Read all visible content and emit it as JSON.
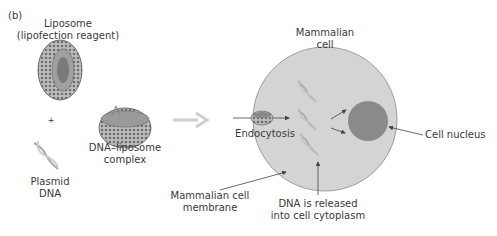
{
  "panel_label": "(b)",
  "labels": {
    "liposome_line1": "Liposome",
    "liposome_line2": "(lipofection reagent)",
    "plus": "+",
    "plasmid_line1": "Plasmid",
    "plasmid_line2": "DNA",
    "complex_line1": "DNA–liposome",
    "complex_line2": "complex",
    "cell_line1": "Mammalian",
    "cell_line2": "cell",
    "endocytosis": "Endocytosis",
    "nucleus": "Cell nucleus",
    "membrane_line1": "Mammalian cell",
    "membrane_line2": "membrane",
    "released_line1": "DNA is released",
    "released_line2": "into cell cytoplasm"
  },
  "colors": {
    "cell_fill": "#d4d4d4",
    "nucleus_fill": "#8a8a8a",
    "arrow_gray": "#cfcfcf",
    "line": "#555555"
  }
}
